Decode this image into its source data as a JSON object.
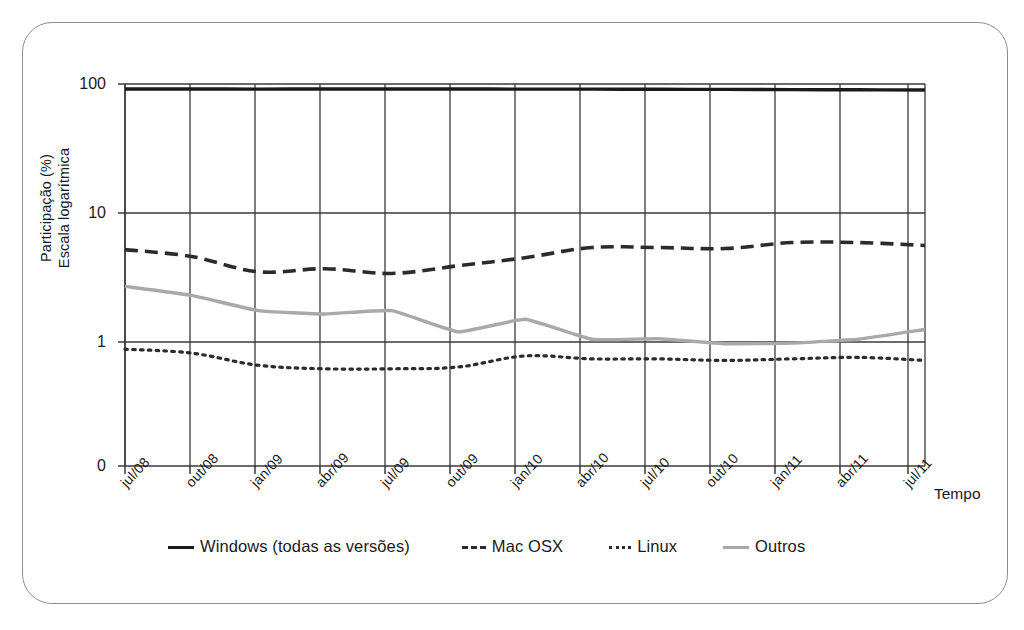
{
  "figure": {
    "frame_color": "#8d8d8d",
    "background": "#ffffff"
  },
  "chart_data": {
    "type": "line",
    "title": "",
    "subtitle": "",
    "xlabel": "Tempo",
    "ylabel": "Participação (%) Escala logarítmica",
    "ylabel_lines": [
      "Participação (%)",
      "Escala logarítmica"
    ],
    "y_scale": "log",
    "y_tick_labels": [
      "100",
      "10",
      "1",
      "0"
    ],
    "y_tick_values": [
      100,
      10,
      1,
      0
    ],
    "ylim": [
      1,
      100
    ],
    "grid": true,
    "grid_axis": "both",
    "legend_position": "bottom",
    "categories": [
      "jul/08",
      "out/08",
      "jan/09",
      "abr/09",
      "jul/09",
      "out/09",
      "jan/10",
      "abr/10",
      "jul/10",
      "out/10",
      "jan/11",
      "abr/11",
      "jul/11"
    ],
    "x": [
      "jul/08",
      "out/08",
      "jan/09",
      "abr/09",
      "jul/09",
      "out/09",
      "jan/10",
      "abr/10",
      "jul/10",
      "out/10",
      "jan/11",
      "abr/11",
      "jul/11"
    ],
    "series": [
      {
        "name": "Windows (todas as versões)",
        "style": "solid",
        "color": "#1a1a1a",
        "values": [
          91.5,
          91.5,
          91.3,
          91.5,
          91.4,
          91.4,
          91.3,
          91.2,
          91.0,
          90.8,
          90.5,
          90.2,
          89.8
        ]
      },
      {
        "name": "Mac OSX",
        "style": "dashed",
        "color": "#2b2b2b",
        "values": [
          5.2,
          4.6,
          3.5,
          3.7,
          3.4,
          3.9,
          4.5,
          5.4,
          5.4,
          5.3,
          5.9,
          5.9,
          5.6
        ]
      },
      {
        "name": "Linux",
        "style": "dotted",
        "color": "#2b2b2b",
        "values": [
          0.88,
          0.82,
          0.66,
          0.62,
          0.62,
          0.64,
          0.78,
          0.74,
          0.74,
          0.72,
          0.74,
          0.76,
          0.72
        ]
      },
      {
        "name": "Outros",
        "style": "solid",
        "color": "#a9a9a9",
        "values": [
          2.7,
          2.3,
          1.75,
          1.65,
          1.75,
          1.2,
          1.5,
          1.05,
          1.06,
          0.97,
          0.98,
          1.05,
          1.25
        ]
      }
    ],
    "annotations": []
  },
  "axes": {
    "y_title_line1": "Participação (%)",
    "y_title_line2": "Escala logarítmica",
    "x_title": "Tempo",
    "y_ticks": [
      {
        "label": "100",
        "value": 100
      },
      {
        "label": "10",
        "value": 10
      },
      {
        "label": "1",
        "value": 1
      },
      {
        "label": "0",
        "value": 0
      }
    ],
    "x_ticks": [
      {
        "label": "jul/08"
      },
      {
        "label": "out/08"
      },
      {
        "label": "jan/09"
      },
      {
        "label": "abr/09"
      },
      {
        "label": "jul/09"
      },
      {
        "label": "out/09"
      },
      {
        "label": "jan/10"
      },
      {
        "label": "abr/10"
      },
      {
        "label": "jul/10"
      },
      {
        "label": "out/10"
      },
      {
        "label": "jan/11"
      },
      {
        "label": "abr/11"
      },
      {
        "label": "jul/11"
      }
    ]
  },
  "legend": {
    "items": [
      {
        "label": "Windows (todas as versões)",
        "style": "solid",
        "color": "#1a1a1a"
      },
      {
        "label": "Mac OSX",
        "style": "dashed",
        "color": "#2b2b2b"
      },
      {
        "label": "Linux",
        "style": "dotted",
        "color": "#2b2b2b"
      },
      {
        "label": "Outros",
        "style": "solid",
        "color": "#a9a9a9"
      }
    ]
  }
}
